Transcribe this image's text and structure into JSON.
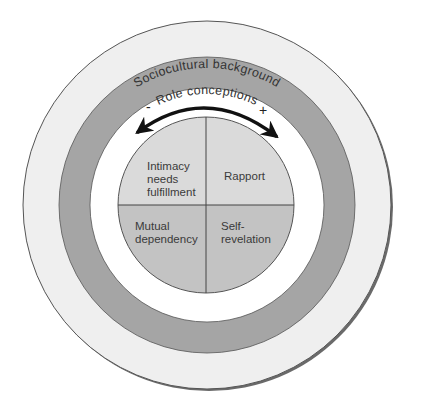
{
  "diagram": {
    "outer_ring": {
      "label": "Sociocultural background",
      "color": "#efefef"
    },
    "middle_ring": {
      "label": "Role conceptions",
      "color": "#a5a5a5"
    },
    "gap_ring": {
      "color": "#ffffff"
    },
    "arrow": {
      "minus_label": "-",
      "plus_label": "+"
    },
    "quadrants": [
      {
        "position": "top-left",
        "lines": [
          "Intimacy",
          "needs",
          "fulfillment"
        ],
        "color": "#dadada"
      },
      {
        "position": "top-right",
        "lines": [
          "Rapport"
        ],
        "color": "#dadada"
      },
      {
        "position": "bottom-left",
        "lines": [
          "Mutual",
          "dependency"
        ],
        "color": "#c3c3c3"
      },
      {
        "position": "bottom-right",
        "lines": [
          "Self-",
          "revelation"
        ],
        "color": "#c3c3c3"
      }
    ]
  }
}
